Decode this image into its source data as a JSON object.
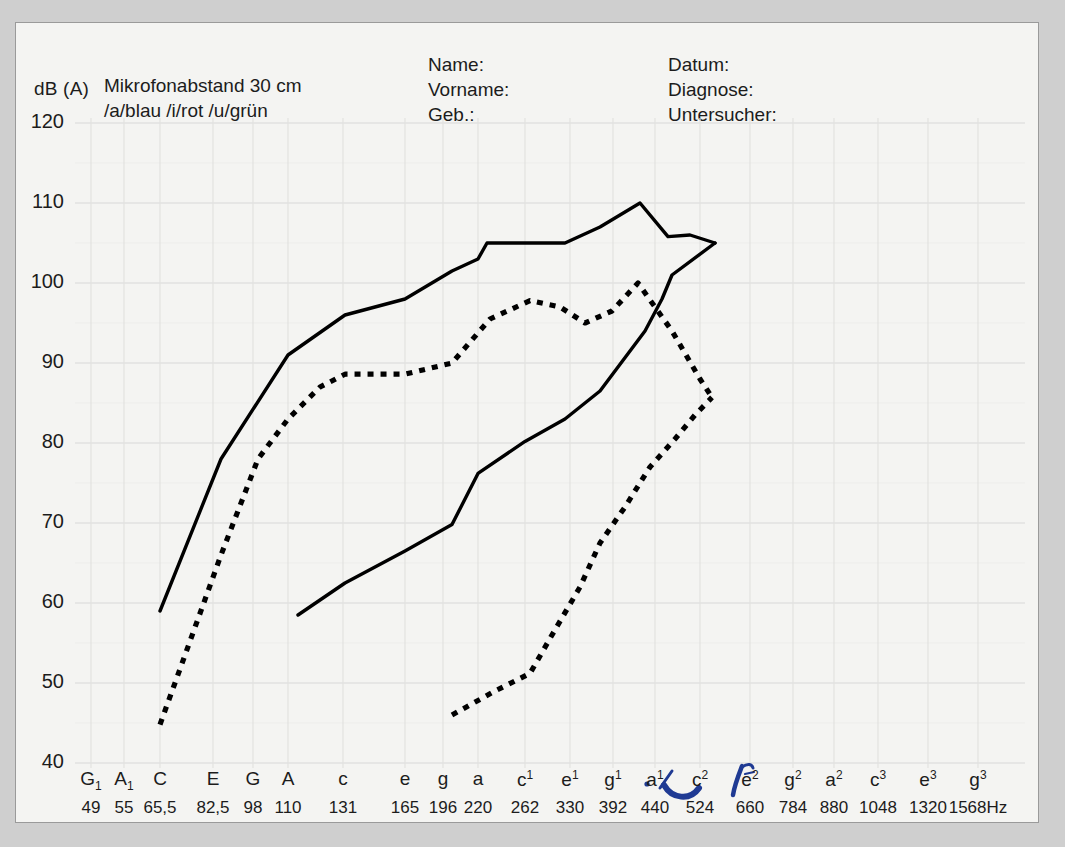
{
  "sheet": {
    "axis_unit_label": "dB (A)",
    "legend_line1": "Mikrofonabstand 30 cm",
    "legend_line2": "/a/blau /i/rot  /u/grün",
    "fields_left": [
      "Name:",
      "Vorname:",
      "Geb.:"
    ],
    "fields_right": [
      "Datum:",
      "Diagnose:",
      "Untersucher:"
    ],
    "freq_unit": "Hz",
    "ink_color": "#1f3a93",
    "curve_color": "#000000",
    "grid_color": "#e2e2e0",
    "paper_color": "#f4f4f2"
  },
  "chart_data": {
    "type": "line",
    "xlabel": "",
    "ylabel": "dB (A)",
    "ylim": [
      40,
      120
    ],
    "yticks": [
      40,
      50,
      60,
      70,
      80,
      90,
      100,
      110,
      120
    ],
    "grid": true,
    "legend": "none",
    "xticks_notes": [
      "G₁",
      "A₁",
      "C",
      "E",
      "G",
      "A",
      "c",
      "e",
      "g",
      "a",
      "c¹",
      "e¹",
      "g¹",
      "a¹",
      "c²",
      "e²",
      "g²",
      "a²",
      "c³",
      "e³",
      "g³"
    ],
    "xticks_freq": [
      49,
      55,
      65.5,
      82.5,
      98,
      110,
      131,
      165,
      196,
      220,
      262,
      330,
      392,
      440,
      524,
      660,
      784,
      880,
      1048,
      1320,
      1568
    ],
    "xticks_freq_labels": [
      "49",
      "55",
      "65,5",
      "82,5",
      "98",
      "110",
      "131",
      "165",
      "196",
      "220",
      "262",
      "330",
      "392",
      "440",
      "524",
      "660",
      "784",
      "880",
      "1048",
      "1320",
      "1568"
    ],
    "series": [
      {
        "name": "solid-upper",
        "style": "solid",
        "points": [
          {
            "x": 160,
            "db": 59
          },
          {
            "x": 221,
            "db": 78
          },
          {
            "x": 288,
            "db": 91
          },
          {
            "x": 345,
            "db": 96
          },
          {
            "x": 405,
            "db": 98
          },
          {
            "x": 452,
            "db": 101.5
          },
          {
            "x": 478,
            "db": 103
          },
          {
            "x": 487,
            "db": 105
          },
          {
            "x": 525,
            "db": 105
          },
          {
            "x": 565,
            "db": 105
          },
          {
            "x": 600,
            "db": 107
          },
          {
            "x": 640,
            "db": 110
          },
          {
            "x": 668,
            "db": 105.8
          },
          {
            "x": 690,
            "db": 106
          },
          {
            "x": 715,
            "db": 105
          }
        ]
      },
      {
        "name": "solid-lower",
        "style": "solid",
        "points": [
          {
            "x": 298,
            "db": 58.5
          },
          {
            "x": 345,
            "db": 62.5
          },
          {
            "x": 405,
            "db": 66.5
          },
          {
            "x": 452,
            "db": 69.8
          },
          {
            "x": 478,
            "db": 76.2
          },
          {
            "x": 525,
            "db": 80.2
          },
          {
            "x": 565,
            "db": 83
          },
          {
            "x": 600,
            "db": 86.5
          },
          {
            "x": 645,
            "db": 94
          },
          {
            "x": 662,
            "db": 98
          },
          {
            "x": 672,
            "db": 101
          },
          {
            "x": 715,
            "db": 105
          }
        ]
      },
      {
        "name": "dotted-upper",
        "style": "dotted",
        "points": [
          {
            "x": 160,
            "db": 44.8
          },
          {
            "x": 221,
            "db": 66
          },
          {
            "x": 258,
            "db": 78
          },
          {
            "x": 288,
            "db": 83
          },
          {
            "x": 320,
            "db": 87
          },
          {
            "x": 345,
            "db": 88.6
          },
          {
            "x": 405,
            "db": 88.6
          },
          {
            "x": 452,
            "db": 90
          },
          {
            "x": 490,
            "db": 95.5
          },
          {
            "x": 530,
            "db": 97.8
          },
          {
            "x": 560,
            "db": 97
          },
          {
            "x": 585,
            "db": 95
          },
          {
            "x": 612,
            "db": 96.5
          },
          {
            "x": 638,
            "db": 100
          },
          {
            "x": 672,
            "db": 94
          },
          {
            "x": 700,
            "db": 88
          },
          {
            "x": 712,
            "db": 85.7
          }
        ]
      },
      {
        "name": "dotted-lower",
        "style": "dotted",
        "points": [
          {
            "x": 452,
            "db": 46
          },
          {
            "x": 495,
            "db": 49
          },
          {
            "x": 530,
            "db": 51.2
          },
          {
            "x": 552,
            "db": 56
          },
          {
            "x": 580,
            "db": 62
          },
          {
            "x": 600,
            "db": 67.5
          },
          {
            "x": 625,
            "db": 72
          },
          {
            "x": 650,
            "db": 77
          },
          {
            "x": 675,
            "db": 80.5
          },
          {
            "x": 695,
            "db": 83.5
          },
          {
            "x": 712,
            "db": 85.7
          }
        ]
      }
    ]
  }
}
